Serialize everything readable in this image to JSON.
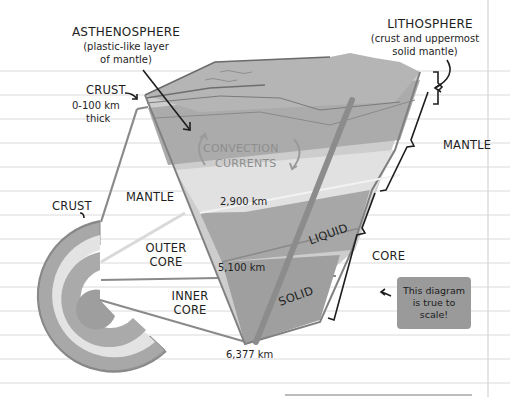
{
  "diagram": {
    "colors": {
      "paper": "#ffffff",
      "rule_line": "#d9d9d9",
      "margin_line": "#d4d4d4",
      "crust_top": "#9c9c9c",
      "lithosphere": "#b8b8b8",
      "asthenosphere": "#a9a9a9",
      "mantle": "#cfcfcf",
      "mantle_light": "#e2e2e2",
      "outer_core": "#a6a6a6",
      "inner_core": "#a0a0a0",
      "outline": "#7d7d7d",
      "ink": "#1e1e1e",
      "note_bg": "#9a9a9a"
    },
    "labels": {
      "asthenosphere_title": "ASTHENOSPHERE",
      "asthenosphere_desc_1": "(plastic-like layer",
      "asthenosphere_desc_2": "of mantle)",
      "lithosphere_title": "LITHOSPHERE",
      "lithosphere_desc_1": "(crust and uppermost",
      "lithosphere_desc_2": "solid mantle)",
      "crust_top": "CRUST",
      "crust_thickness_1": "0-100 km",
      "crust_thickness_2": "thick",
      "crust_side": "CRUST",
      "convection_1": "CONVECTION",
      "convection_2": "CURRENTS",
      "mantle_left": "MANTLE",
      "mantle_right": "MANTLE",
      "depth_mantle": "2,900 km",
      "outer_core_1": "OUTER",
      "outer_core_2": "CORE",
      "depth_outer_core": "5,100 km",
      "inner_core_1": "INNER",
      "inner_core_2": "CORE",
      "depth_center": "6,377 km",
      "liquid": "LIQUID",
      "solid": "SOLID",
      "core_right": "CORE"
    },
    "note": {
      "line_1": "This diagram",
      "line_2": "is true to",
      "line_3": "scale!"
    },
    "layers": [
      {
        "name": "Crust",
        "depth_range": "0-100 km"
      },
      {
        "name": "Mantle",
        "depth_to_km": 2900
      },
      {
        "name": "Outer Core",
        "state": "Liquid",
        "depth_to_km": 5100
      },
      {
        "name": "Inner Core",
        "state": "Solid",
        "depth_to_km": 6377
      }
    ]
  }
}
